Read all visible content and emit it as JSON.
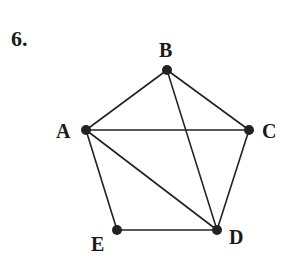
{
  "problem": {
    "number_label": "6."
  },
  "graph": {
    "edge_color": "#222222",
    "vertex_color": "#222222",
    "vertices": [
      {
        "id": "A",
        "label": "A",
        "x": 86,
        "y": 130,
        "label_x": 56,
        "label_y": 121
      },
      {
        "id": "B",
        "label": "B",
        "x": 167,
        "y": 70,
        "label_x": 159,
        "label_y": 40
      },
      {
        "id": "C",
        "label": "C",
        "x": 249,
        "y": 130,
        "label_x": 262,
        "label_y": 121
      },
      {
        "id": "D",
        "label": "D",
        "x": 217,
        "y": 230,
        "label_x": 229,
        "label_y": 227
      },
      {
        "id": "E",
        "label": "E",
        "x": 117,
        "y": 230,
        "label_x": 91,
        "label_y": 234
      }
    ],
    "edges": [
      [
        "A",
        "B"
      ],
      [
        "B",
        "C"
      ],
      [
        "A",
        "C"
      ],
      [
        "B",
        "D"
      ],
      [
        "C",
        "D"
      ],
      [
        "A",
        "D"
      ],
      [
        "A",
        "E"
      ],
      [
        "E",
        "D"
      ]
    ]
  }
}
